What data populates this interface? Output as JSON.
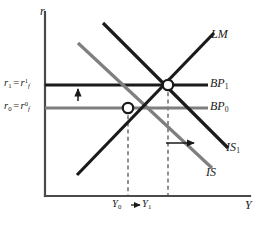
{
  "figure": {
    "background": "#ffffff"
  },
  "axes": {
    "y_axis_label": "r",
    "x_axis_label": "Y",
    "y_ticks": [
      {
        "id": "r1",
        "lead": "r",
        "lead_sub": "1",
        "eq": "=",
        "tail": "r",
        "tail_sub": "f",
        "tail_sup": "1",
        "value_y": 85
      },
      {
        "id": "r0",
        "lead": "r",
        "lead_sub": "0",
        "eq": "=",
        "tail": "r",
        "tail_sub": "f",
        "tail_sup": "0",
        "value_y": 108
      }
    ],
    "x_ticks": [
      {
        "id": "Y0",
        "lead": "Y",
        "lead_sub": "0",
        "value_x": 128
      },
      {
        "id": "Y1",
        "lead": "Y",
        "lead_sub": "1",
        "value_x": 168
      }
    ]
  },
  "curves": [
    {
      "id": "LM",
      "label": "LM",
      "label_sub": "",
      "color": "#1a1a1a",
      "width": 3.2,
      "x1": 77,
      "y1": 175,
      "x2": 214,
      "y2": 33
    },
    {
      "id": "IS0",
      "label": "IS",
      "label_sub": "",
      "color": "#7f7f7f",
      "width": 3.2,
      "x1": 78,
      "y1": 43,
      "x2": 212,
      "y2": 168
    },
    {
      "id": "IS1",
      "label": "IS",
      "label_sub": "1",
      "color": "#1a1a1a",
      "width": 3.2,
      "x1": 103,
      "y1": 23,
      "x2": 228,
      "y2": 148
    },
    {
      "id": "BP1",
      "label": "BP",
      "label_sub": "1",
      "color": "#1a1a1a",
      "width": 3.2,
      "x1": 45,
      "y1": 85,
      "x2": 208,
      "y2": 85
    },
    {
      "id": "BP0",
      "label": "BP",
      "label_sub": "0",
      "color": "#7f7f7f",
      "width": 3.2,
      "x1": 45,
      "y1": 108,
      "x2": 208,
      "y2": 108
    }
  ],
  "equilibria": [
    {
      "id": "E0",
      "x": 128,
      "y": 108,
      "fill": "#ffffff",
      "stroke": "#1a1a1a"
    },
    {
      "id": "E1",
      "x": 168,
      "y": 85,
      "fill": "#ffffff",
      "stroke": "#1a1a1a"
    }
  ],
  "guides": [
    {
      "id": "guide-Y0",
      "x": 128,
      "y_top": 108,
      "y_bottom": 196
    },
    {
      "id": "guide-Y1",
      "x": 168,
      "y_top": 85,
      "y_bottom": 196
    }
  ],
  "arrows": [
    {
      "id": "rate-up-arrow",
      "direction": "up",
      "x1": 78,
      "y1": 101,
      "x2": 78,
      "y2": 88
    },
    {
      "id": "is-shift-arrow",
      "direction": "right",
      "x1": 166,
      "y1": 143,
      "x2": 196,
      "y2": 143
    },
    {
      "id": "output-shift-arrow",
      "direction": "right",
      "x1": 131,
      "y1": 205,
      "x2": 141,
      "y2": 205
    }
  ],
  "colors": {
    "ink": "#1a1a1a",
    "gray_curve": "#7f7f7f",
    "axis": "#4a4a4a",
    "guide": "#555555"
  }
}
